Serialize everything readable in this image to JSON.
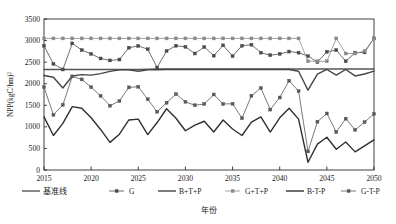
{
  "chart_data": {
    "type": "line",
    "title": "",
    "xlabel": "年份",
    "ylabel": "NPP(kgC/hm²)",
    "xlim": [
      2015,
      2050
    ],
    "ylim": [
      0,
      3500
    ],
    "ytick_labels": [
      "0",
      "500",
      "1000",
      "1500",
      "2000",
      "2500",
      "3000",
      "3500"
    ],
    "ytick_values": [
      0,
      500,
      1000,
      1500,
      2000,
      2500,
      3000,
      3500
    ],
    "xtick_labels": [
      "2015",
      "2020",
      "2025",
      "2030",
      "2035",
      "2040",
      "2045",
      "2050"
    ],
    "xtick_values": [
      2015,
      2020,
      2025,
      2030,
      2035,
      2040,
      2045,
      2050
    ],
    "grid": false,
    "legend_position": "bottom",
    "x": [
      2015,
      2016,
      2017,
      2018,
      2019,
      2020,
      2021,
      2022,
      2023,
      2024,
      2025,
      2026,
      2027,
      2028,
      2029,
      2030,
      2031,
      2032,
      2033,
      2034,
      2035,
      2036,
      2037,
      2038,
      2039,
      2040,
      2041,
      2042,
      2043,
      2044,
      2045,
      2046,
      2047,
      2048,
      2049,
      2050
    ],
    "series": [
      {
        "name": "基准线",
        "color": "#555555",
        "marker": "none",
        "width": 1.4,
        "values": [
          2330,
          2330,
          2330,
          2330,
          2330,
          2330,
          2330,
          2330,
          2330,
          2330,
          2330,
          2335,
          2340,
          2340,
          2340,
          2340,
          2340,
          2340,
          2340,
          2340,
          2340,
          2340,
          2340,
          2340,
          2340,
          2340,
          2340,
          2340,
          2340,
          2340,
          2340,
          2340,
          2340,
          2340,
          2340,
          2340
        ]
      },
      {
        "name": "G",
        "color": "#4a4a4a",
        "marker": "square",
        "width": 0.8,
        "values": [
          2880,
          2460,
          2330,
          2935,
          2780,
          2690,
          2585,
          2540,
          2560,
          2835,
          2875,
          2800,
          2375,
          2760,
          2880,
          2855,
          2700,
          2850,
          2650,
          2890,
          2640,
          2880,
          2905,
          2720,
          2660,
          2690,
          2745,
          2720,
          2640,
          2500,
          2740,
          2780,
          2520,
          2720,
          2725,
          3050
        ]
      },
      {
        "name": "B+T+P",
        "color": "#444444",
        "marker": "none",
        "width": 1.4,
        "values": [
          2190,
          2150,
          1900,
          2180,
          2210,
          2200,
          2235,
          2285,
          2320,
          2320,
          2290,
          2320,
          2325,
          2330,
          2330,
          2330,
          2330,
          2330,
          2330,
          2330,
          2330,
          2330,
          2330,
          2330,
          2330,
          2330,
          2330,
          2290,
          1850,
          2220,
          2330,
          2200,
          2330,
          2180,
          2225,
          2290
        ]
      },
      {
        "name": "G+T+P",
        "color": "#8a8a8a",
        "marker": "square",
        "width": 0.8,
        "values": [
          3050,
          3050,
          3050,
          3050,
          3050,
          3050,
          3050,
          3050,
          3050,
          3050,
          3050,
          3050,
          3050,
          3050,
          3050,
          3050,
          3050,
          3050,
          3050,
          3050,
          3050,
          3050,
          3050,
          3050,
          3050,
          3050,
          3050,
          3050,
          2520,
          2520,
          2520,
          3050,
          2700,
          2700,
          2760,
          3050
        ]
      },
      {
        "name": "B-T-P",
        "color": "#303030",
        "marker": "none",
        "width": 1.4,
        "values": [
          1230,
          800,
          1080,
          1470,
          1430,
          1210,
          940,
          640,
          830,
          1160,
          1180,
          820,
          1100,
          1420,
          1200,
          910,
          1040,
          1130,
          880,
          1160,
          950,
          800,
          1110,
          1230,
          880,
          1210,
          1430,
          1180,
          180,
          600,
          760,
          480,
          650,
          420,
          560,
          700
        ]
      },
      {
        "name": "G-T-P",
        "color": "#585858",
        "marker": "square",
        "width": 0.8,
        "values": [
          1920,
          1280,
          1510,
          2170,
          2100,
          1920,
          1720,
          1490,
          1600,
          1915,
          1930,
          1640,
          1350,
          1560,
          1760,
          1580,
          1500,
          1530,
          1750,
          1530,
          1535,
          1200,
          1720,
          1900,
          1400,
          1680,
          2070,
          1830,
          430,
          1120,
          1310,
          880,
          1190,
          930,
          1110,
          1300
        ]
      }
    ]
  },
  "legend": {
    "items": [
      {
        "label": "基准线",
        "style": "line",
        "cn": true
      },
      {
        "label": "G",
        "style": "line-marker",
        "cn": false
      },
      {
        "label": "B+T+P",
        "style": "line",
        "cn": false
      },
      {
        "label": "G+T+P",
        "style": "line-marker",
        "cn": false
      },
      {
        "label": "B-T-P",
        "style": "line",
        "cn": false
      },
      {
        "label": "G-T-P",
        "style": "line-marker",
        "cn": false
      }
    ]
  }
}
